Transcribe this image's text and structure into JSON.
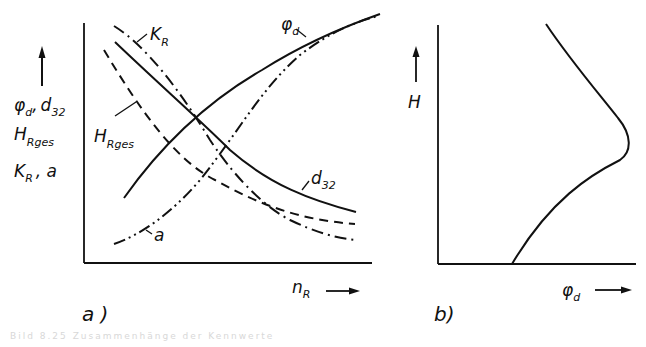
{
  "figure_a": {
    "panel_label": "a )",
    "y_axis_labels": {
      "line1_main": "φ",
      "line1_sub": "d",
      "line1_sep": ",",
      "line1_main2": "d",
      "line1_sub2": "32",
      "line2_main": "H",
      "line2_sub": "Rges",
      "line3_main": "K",
      "line3_sub": "R",
      "line3_rest": ", a"
    },
    "x_axis_label": {
      "main": "n",
      "sub": "R"
    },
    "curves": [
      {
        "name": "φd",
        "label_main": "φ",
        "label_sub": "d",
        "style": "solid",
        "trend": "increasing"
      },
      {
        "name": "d32",
        "label_main": "d",
        "label_sub": "32",
        "style": "solid",
        "trend": "decreasing"
      },
      {
        "name": "HRges",
        "label_main": "H",
        "label_sub": "Rges",
        "style": "dashed",
        "trend": "decreasing"
      },
      {
        "name": "KR",
        "label_main": "K",
        "label_sub": "R",
        "style": "dash-dot",
        "trend": "decreasing"
      },
      {
        "name": "a",
        "label_main": "a",
        "label_sub": "",
        "style": "dash-dot-dot",
        "trend": "increasing"
      }
    ]
  },
  "figure_b": {
    "panel_label": "b)",
    "y_axis_label": "H",
    "x_axis_label": {
      "main": "φ",
      "sub": "d"
    },
    "curve": {
      "name": "φd(H)",
      "style": "solid",
      "shape": "bulge with maximum at mid height"
    }
  },
  "caption": "Bild 8.25   Zusammenhänge der Kennwerte"
}
